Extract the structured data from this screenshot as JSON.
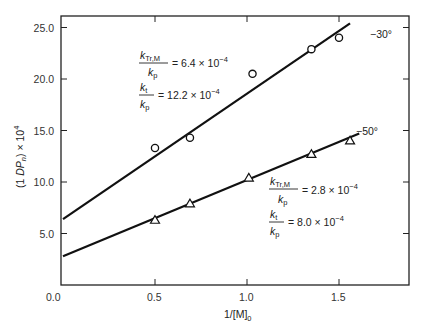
{
  "chart_data": {
    "type": "scatter",
    "title": "",
    "xlabel": "1/[M]0",
    "ylabel": "(1 DPn) × 10^4",
    "xlim": [
      0,
      1.9
    ],
    "ylim": [
      0,
      26.5
    ],
    "x_ticks": [
      "0.0",
      "0.5",
      "1.0",
      "1.5"
    ],
    "y_ticks": [
      "0.0",
      "5.0",
      "10.0",
      "15.0",
      "20.0",
      "25.0"
    ],
    "grid": false,
    "legend": "none (inline labels)",
    "series": [
      {
        "name": "-30°",
        "marker": "circle",
        "points": [
          [
            0.5,
            13.3
          ],
          [
            0.69,
            14.3
          ],
          [
            1.03,
            20.5
          ],
          [
            1.35,
            22.9
          ],
          [
            1.5,
            24.0
          ]
        ],
        "fit_line": {
          "x": [
            0,
            1.56
          ],
          "y": [
            6.4,
            25.4
          ]
        },
        "annotation": {
          "ktr_label": "k",
          "ktr_sub": "Tr,M",
          "ktr_value": "= 6.4 × 10",
          "kt_label": "k",
          "kt_sub": "t",
          "kt_value": "= 12.2 × 10",
          "kp_label": "k",
          "kp_sub": "p",
          "exp": "−4"
        }
      },
      {
        "name": "-50°",
        "marker": "triangle",
        "points": [
          [
            0.5,
            6.3
          ],
          [
            0.69,
            7.9
          ],
          [
            1.01,
            10.4
          ],
          [
            1.35,
            12.7
          ],
          [
            1.56,
            14.0
          ]
        ],
        "fit_line": {
          "x": [
            0,
            1.61
          ],
          "y": [
            2.8,
            14.7
          ]
        },
        "annotation": {
          "ktr_label": "k",
          "ktr_sub": "Tr,M",
          "ktr_value": "= 2.8 × 10",
          "kt_label": "k",
          "kt_sub": "t",
          "kt_value": "= 8.0 × 10",
          "kp_label": "k",
          "kp_sub": "p",
          "exp": "−4"
        }
      }
    ]
  },
  "labels": {
    "series1": "−30°",
    "series2": "−50°",
    "xlabel_main": "1/[M]",
    "xlabel_sub": "0",
    "ylabel_a": "(1 ",
    "ylabel_b": "DP",
    "ylabel_sub": "n",
    "ylabel_c": ") × 10",
    "ylabel_exp": "4"
  }
}
